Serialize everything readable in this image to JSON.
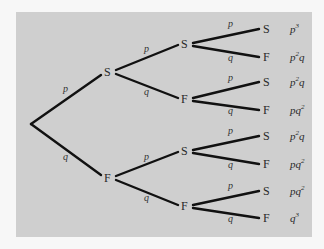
{
  "diagram": {
    "type": "probability-tree",
    "background_color": "#cfcfcf",
    "line_color": "#111111",
    "root": {
      "x": 31,
      "y": 124
    },
    "level1": [
      {
        "label": "S",
        "x": 108,
        "y": 72,
        "edge_label": "p",
        "edge_label_pos": [
          63,
          92
        ]
      },
      {
        "label": "F",
        "x": 108,
        "y": 178,
        "edge_label": "q",
        "edge_label_pos": [
          63,
          160
        ]
      }
    ],
    "level2": [
      {
        "label": "S",
        "parent": 0,
        "x": 185,
        "y": 44,
        "edge_label": "p",
        "edge_label_pos": [
          144,
          52
        ]
      },
      {
        "label": "F",
        "parent": 0,
        "x": 185,
        "y": 99,
        "edge_label": "q",
        "edge_label_pos": [
          144,
          95
        ]
      },
      {
        "label": "S",
        "parent": 1,
        "x": 185,
        "y": 151,
        "edge_label": "p",
        "edge_label_pos": [
          144,
          160
        ]
      },
      {
        "label": "F",
        "parent": 1,
        "x": 185,
        "y": 206,
        "edge_label": "q",
        "edge_label_pos": [
          144,
          201
        ]
      }
    ],
    "level3": [
      {
        "label": "S",
        "parent": 0,
        "x": 267,
        "y": 29,
        "edge_label": "p",
        "edge_label_pos": [
          228,
          27
        ],
        "result_base": "p",
        "result_sup": "3",
        "result_tail": ""
      },
      {
        "label": "F",
        "parent": 0,
        "x": 267,
        "y": 57,
        "edge_label": "q",
        "edge_label_pos": [
          228,
          61
        ],
        "result_base": "p",
        "result_sup": "2",
        "result_tail": "q"
      },
      {
        "label": "S",
        "parent": 1,
        "x": 267,
        "y": 82,
        "edge_label": "p",
        "edge_label_pos": [
          228,
          81
        ],
        "result_base": "p",
        "result_sup": "2",
        "result_tail": "q"
      },
      {
        "label": "F",
        "parent": 1,
        "x": 267,
        "y": 110,
        "edge_label": "q",
        "edge_label_pos": [
          228,
          114
        ],
        "result_base": "pq",
        "result_sup": "2",
        "result_tail": ""
      },
      {
        "label": "S",
        "parent": 2,
        "x": 267,
        "y": 136,
        "edge_label": "p",
        "edge_label_pos": [
          228,
          134
        ],
        "result_base": "p",
        "result_sup": "2",
        "result_tail": "q"
      },
      {
        "label": "F",
        "parent": 2,
        "x": 267,
        "y": 164,
        "edge_label": "q",
        "edge_label_pos": [
          228,
          168
        ],
        "result_base": "pq",
        "result_sup": "2",
        "result_tail": ""
      },
      {
        "label": "S",
        "parent": 3,
        "x": 267,
        "y": 191,
        "edge_label": "p",
        "edge_label_pos": [
          228,
          189
        ],
        "result_base": "pq",
        "result_sup": "2",
        "result_tail": ""
      },
      {
        "label": "F",
        "parent": 3,
        "x": 267,
        "y": 218,
        "edge_label": "q",
        "edge_label_pos": [
          228,
          222
        ],
        "result_base": "q",
        "result_sup": "3",
        "result_tail": ""
      }
    ]
  }
}
